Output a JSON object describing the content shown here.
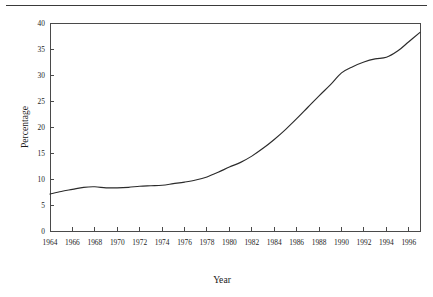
{
  "figure": {
    "has_top_rule": true,
    "background_color": "#ffffff",
    "line_color": "#2b2b2b",
    "axis_color": "#4a4a4a"
  },
  "chart_data": {
    "type": "line",
    "title": "",
    "xlabel": "Year",
    "ylabel": "Percentage",
    "xlim": [
      1964,
      1997
    ],
    "ylim": [
      0,
      40
    ],
    "grid": false,
    "legend": false,
    "xticks": [
      1964,
      1966,
      1968,
      1970,
      1972,
      1974,
      1976,
      1978,
      1980,
      1982,
      1984,
      1986,
      1988,
      1990,
      1992,
      1994,
      1996
    ],
    "xtick_labels": [
      "1964",
      "1966",
      "1968",
      "1970",
      "1972",
      "1974",
      "1976",
      "1978",
      "1980",
      "1982",
      "1984",
      "1986",
      "1988",
      "1990",
      "1992",
      "1994",
      "1996"
    ],
    "yticks": [
      0,
      5,
      10,
      15,
      20,
      25,
      30,
      35,
      40
    ],
    "ytick_labels": [
      "0",
      "5",
      "10",
      "15",
      "20",
      "25",
      "30",
      "35",
      "40"
    ],
    "series": [
      {
        "name": "Percentage",
        "x": [
          1964,
          1965,
          1966,
          1967,
          1968,
          1969,
          1970,
          1971,
          1972,
          1973,
          1974,
          1975,
          1976,
          1977,
          1978,
          1979,
          1980,
          1981,
          1982,
          1983,
          1984,
          1985,
          1986,
          1987,
          1988,
          1989,
          1990,
          1991,
          1992,
          1993,
          1994,
          1995,
          1996,
          1997
        ],
        "values": [
          7.1,
          7.6,
          8.0,
          8.4,
          8.5,
          8.3,
          8.3,
          8.4,
          8.6,
          8.7,
          8.8,
          9.1,
          9.4,
          9.8,
          10.4,
          11.3,
          12.3,
          13.2,
          14.4,
          15.9,
          17.6,
          19.5,
          21.6,
          23.8,
          26.0,
          28.1,
          30.4,
          31.6,
          32.5,
          33.1,
          33.4,
          34.6,
          36.4,
          38.2
        ]
      }
    ]
  },
  "axis_titles": {
    "y": "Percentage",
    "x": "Year"
  }
}
